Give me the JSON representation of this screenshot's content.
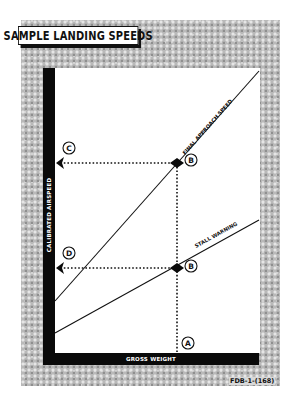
{
  "title": "SAMPLE LANDING SPEEDS",
  "axes": {
    "y_label": "CALIBRATED AIRSPEED",
    "x_label": "GROSS WEIGHT"
  },
  "lines": [
    {
      "name": "final-approach-speed",
      "label": "FINAL APPROACH SPEED",
      "from": [
        55,
        301
      ],
      "to": [
        259,
        71
      ]
    },
    {
      "name": "stall-warning",
      "label": "STALL WARNING",
      "from": [
        55,
        333
      ],
      "to": [
        259,
        220
      ]
    }
  ],
  "markers": {
    "A": {
      "label": "A",
      "cx": 188,
      "cy": 343
    },
    "B_upper": {
      "label": "B",
      "cx": 191,
      "cy": 160
    },
    "B_lower": {
      "label": "B",
      "cx": 191,
      "cy": 266
    },
    "C": {
      "label": "C",
      "cx": 69,
      "cy": 148
    },
    "D": {
      "label": "D",
      "cx": 69,
      "cy": 253
    }
  },
  "figure_id": "FDB-1-(168)",
  "colors": {
    "ink": "#0a0a0a",
    "texture": "#b9b9b9",
    "panel": "#ffffff"
  }
}
